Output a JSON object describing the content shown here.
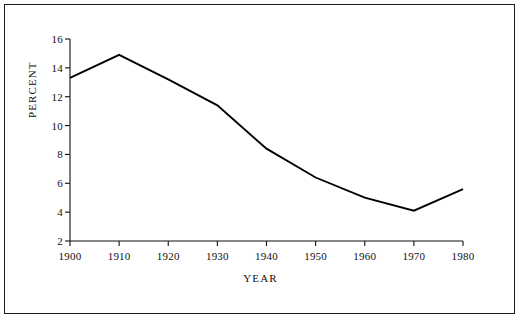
{
  "chart_data": {
    "type": "line",
    "title": "",
    "xlabel": "YEAR",
    "ylabel": "PERCENT",
    "x": [
      1900,
      1910,
      1920,
      1930,
      1940,
      1950,
      1960,
      1970,
      1980
    ],
    "values": [
      13.3,
      14.9,
      13.2,
      11.4,
      8.4,
      6.4,
      5.0,
      4.1,
      5.6
    ],
    "series": [
      {
        "name": "percent",
        "values": [
          13.3,
          14.9,
          13.2,
          11.4,
          8.4,
          6.4,
          5.0,
          4.1,
          5.6
        ]
      }
    ],
    "xlim": [
      1900,
      1980
    ],
    "ylim": [
      2,
      16
    ],
    "xticks": [
      "1900",
      "1910",
      "1920",
      "1930",
      "1940",
      "1950",
      "1960",
      "1970",
      "1980"
    ],
    "yticks": [
      "2",
      "4",
      "6",
      "8",
      "10",
      "12",
      "14",
      "16"
    ],
    "grid": false,
    "legend": false,
    "line_color": "#000000"
  },
  "axes": {
    "y_tick_labels": [
      "16",
      "14",
      "12",
      "10",
      "8",
      "6",
      "4",
      "2"
    ],
    "x_tick_labels": [
      "1900",
      "1910",
      "1920",
      "1930",
      "1940",
      "1950",
      "1960",
      "1970",
      "1980"
    ],
    "y_axis_title": "PERCENT",
    "x_axis_title": "YEAR"
  }
}
